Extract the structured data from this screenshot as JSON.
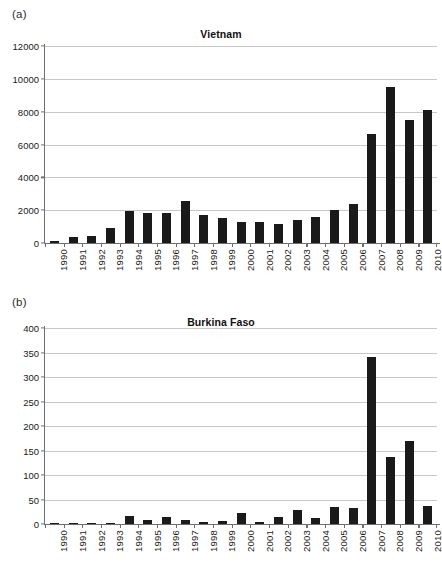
{
  "figure": {
    "background": "#ffffff",
    "bar_color": "#1a1a1a",
    "gridline_color": "#c8c8c8",
    "axis_color": "#6e6e6e"
  },
  "panels": [
    {
      "label": "(a)",
      "title": "Vietnam"
    },
    {
      "label": "(b)",
      "title": "Burkina Faso"
    }
  ],
  "chart_data": [
    {
      "type": "bar",
      "title": "Vietnam",
      "panel_label": "(a)",
      "xlabel": "",
      "ylabel": "",
      "ylim": [
        0,
        12000
      ],
      "ytick_step": 2000,
      "yticks": [
        0,
        2000,
        4000,
        6000,
        8000,
        10000,
        12000
      ],
      "ytick_labels": [
        "0",
        "2000",
        "4000",
        "6000",
        "8000",
        "10000",
        "12000"
      ],
      "grid": true,
      "legend": "none",
      "categories": [
        "1990",
        "1991",
        "1992",
        "1993",
        "1994",
        "1995",
        "1996",
        "1997",
        "1998",
        "1999",
        "2000",
        "2001",
        "2002",
        "2003",
        "2004",
        "2005",
        "2006",
        "2007",
        "2008",
        "2009",
        "2010"
      ],
      "values": [
        150,
        370,
        450,
        900,
        1950,
        1820,
        1820,
        2560,
        1700,
        1500,
        1250,
        1290,
        1180,
        1430,
        1580,
        2040,
        2400,
        6650,
        9500,
        7500,
        8100
      ]
    },
    {
      "type": "bar",
      "title": "Burkina Faso",
      "panel_label": "(b)",
      "xlabel": "",
      "ylabel": "",
      "ylim": [
        0,
        400
      ],
      "ytick_step": 50,
      "yticks": [
        0,
        50,
        100,
        150,
        200,
        250,
        300,
        350,
        400
      ],
      "ytick_labels": [
        "0",
        "50",
        "100",
        "150",
        "200",
        "250",
        "300",
        "350",
        "400"
      ],
      "grid": true,
      "legend": "none",
      "categories": [
        "1990",
        "1991",
        "1992",
        "1993",
        "1994",
        "1995",
        "1996",
        "1997",
        "1998",
        "1999",
        "2000",
        "2001",
        "2002",
        "2003",
        "2004",
        "2005",
        "2006",
        "2007",
        "2008",
        "2009",
        "2010"
      ],
      "values": [
        1,
        1,
        2,
        3,
        17,
        8,
        15,
        8,
        4,
        7,
        22,
        5,
        14,
        28,
        13,
        34,
        33,
        341,
        137,
        170,
        37
      ]
    }
  ]
}
